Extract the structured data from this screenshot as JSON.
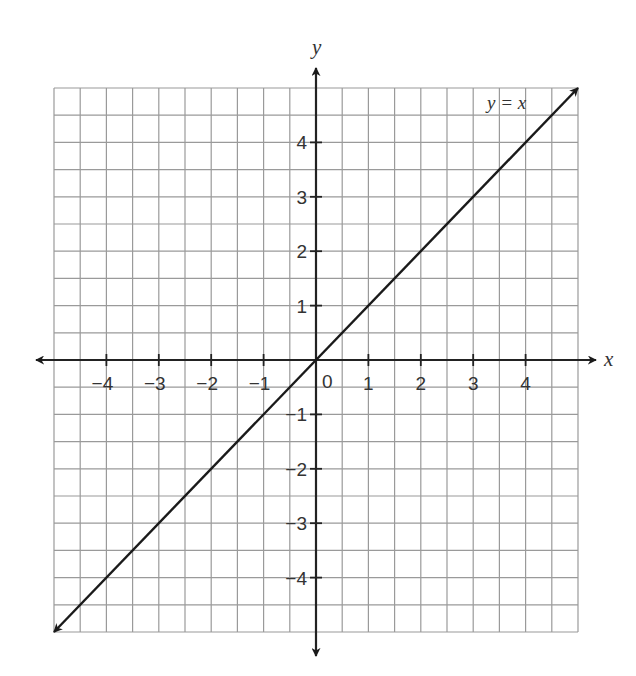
{
  "chart_data": {
    "type": "line",
    "title": "",
    "xlabel": "x",
    "ylabel": "y",
    "xlim": [
      -5,
      5
    ],
    "ylim": [
      -5,
      5
    ],
    "grid": true,
    "grid_step": 0.5,
    "x_ticks": [
      -4,
      -3,
      -2,
      -1,
      1,
      2,
      3,
      4
    ],
    "y_ticks": [
      -4,
      -3,
      -2,
      -1,
      1,
      2,
      3,
      4
    ],
    "origin_label": "0",
    "series": [
      {
        "name": "y = x",
        "x": [
          -5,
          5
        ],
        "y": [
          -5,
          5
        ],
        "arrows": "both"
      }
    ],
    "annotations": [
      {
        "text": "y = x",
        "x": 3.6,
        "y": 4.6
      }
    ]
  },
  "labels": {
    "x_axis": "x",
    "y_axis": "y",
    "origin": "0",
    "line": "y = x"
  },
  "colors": {
    "grid": "#9a9a9a",
    "axis": "#222222",
    "line": "#1a1a1a",
    "text": "#333333"
  }
}
